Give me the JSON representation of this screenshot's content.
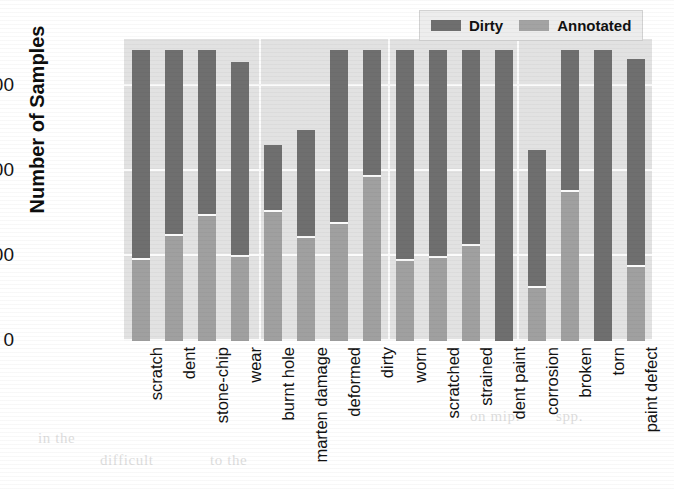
{
  "chart_data": {
    "type": "bar",
    "subtype": "stacked-vertical",
    "title": "",
    "xlabel": "",
    "ylabel": "Number of Samples",
    "ylim": [
      0,
      3550
    ],
    "yticks": [
      0,
      1000,
      2000,
      3000
    ],
    "ytick_labels": [
      "0",
      "1000",
      "2000",
      "3000"
    ],
    "grid": true,
    "legend_position": "upper right",
    "categories": [
      "scratch",
      "dent",
      "stone-chip",
      "wear",
      "burnt hole",
      "marten damage",
      "deformed",
      "dirty",
      "worn",
      "scratched",
      "strained",
      "dent paint",
      "corrosion",
      "broken",
      "torn",
      "paint defect"
    ],
    "series": [
      {
        "name": "Dirty",
        "color": "#6f6f6f",
        "values": [
          3420,
          3420,
          3420,
          3280,
          2300,
          2480,
          3420,
          3420,
          3420,
          3420,
          3420,
          3420,
          2240,
          3420,
          3420,
          3320
        ]
      },
      {
        "name": "Annotated",
        "color": "#a0a0a0",
        "values": [
          950,
          1230,
          1470,
          990,
          1520,
          1210,
          1380,
          1930,
          940,
          980,
          1120,
          0,
          620,
          1750,
          0,
          870
        ]
      }
    ]
  },
  "legend": {
    "entries": [
      {
        "label": "Dirty",
        "swatch": "dirty-swatch"
      },
      {
        "label": "Annotated",
        "swatch": "annotated-swatch"
      }
    ]
  },
  "background_text": {
    "line1": "on mip.",
    "line2": "spp.",
    "line3": "in the",
    "line4": "difficult",
    "line5": "to the"
  }
}
